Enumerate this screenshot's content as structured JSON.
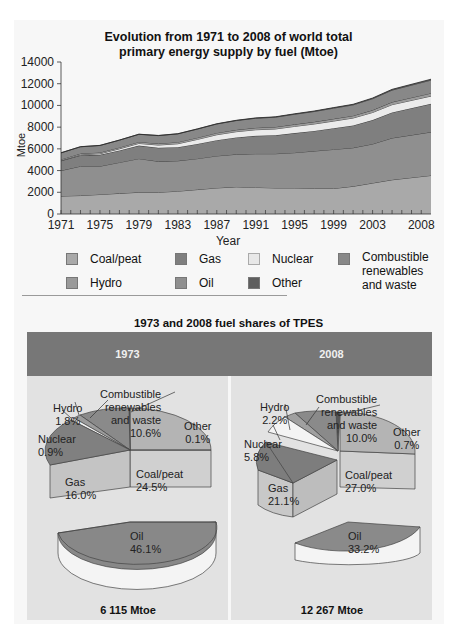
{
  "top_chart": {
    "title_line1": "Evolution from 1971 to 2008 of world total",
    "title_line2": "primary energy supply by fuel (Mtoe)",
    "ylabel": "Mtoe",
    "xlabel": "Year",
    "yticks": [
      "0",
      "2000",
      "4000",
      "6000",
      "8000",
      "10000",
      "12000",
      "14000"
    ],
    "xticks": [
      "1971",
      "1975",
      "1979",
      "1983",
      "1987",
      "1991",
      "1995",
      "1999",
      "2003",
      "2008"
    ]
  },
  "legend": {
    "coal": "Coal/peat",
    "gas": "Gas",
    "nuclear": "Nuclear",
    "combustible_1": "Combustible",
    "combustible_2": "renewables",
    "combustible_3": "and waste",
    "hydro": "Hydro",
    "oil": "Oil",
    "other": "Other"
  },
  "pie_section": {
    "title": "1973 and 2008 fuel shares of  TPES",
    "left": {
      "year": "1973",
      "total": "6 115 Mtoe",
      "labels": {
        "comb1": "Combustible",
        "comb2": "renewables",
        "comb3": "and waste",
        "comb_pct": "10.6%",
        "hydro": "Hydro",
        "hydro_pct": "1.8%",
        "nuclear": "Nuclear",
        "nuclear_pct": "0.9%",
        "other": "Other",
        "other_pct": "0.1%",
        "gas": "Gas",
        "gas_pct": "16.0%",
        "coal": "Coal/peat",
        "coal_pct": "24.5%",
        "oil": "Oil",
        "oil_pct": "46.1%"
      }
    },
    "right": {
      "year": "2008",
      "total": "12 267 Mtoe",
      "labels": {
        "comb1": "Combustible",
        "comb2": "renewables",
        "comb3": "and waste",
        "comb_pct": "10.0%",
        "hydro": "Hydro",
        "hydro_pct": "2.2%",
        "nuclear": "Nuclear",
        "nuclear_pct": "5.8%",
        "other": "Other",
        "other_pct": "0.7%",
        "gas": "Gas",
        "gas_pct": "21.1%",
        "coal": "Coal/peat",
        "coal_pct": "27.0%",
        "oil": "Oil",
        "oil_pct": "33.2%"
      }
    }
  },
  "colors": {
    "coal": "#a9a9a9",
    "oil": "#8c8c8c",
    "gas": "#7f7f7f",
    "nuclear": "#e6e6e6",
    "hydro": "#9a9a9a",
    "combustible": "#888888",
    "other": "#5e5e5e",
    "header": "#777777"
  },
  "chart_data": [
    {
      "type": "area",
      "title": "Evolution from 1971 to 2008 of world total primary energy supply by fuel (Mtoe)",
      "xlabel": "Year",
      "ylabel": "Mtoe",
      "ylim": [
        0,
        14000
      ],
      "x": [
        1971,
        1973,
        1975,
        1977,
        1979,
        1981,
        1983,
        1985,
        1987,
        1989,
        1991,
        1993,
        1995,
        1997,
        1999,
        2001,
        2003,
        2005,
        2008
      ],
      "stacked": true,
      "series": [
        {
          "name": "Coal/peat",
          "values": [
            1650,
            1700,
            1800,
            1900,
            2000,
            2000,
            2100,
            2250,
            2400,
            2500,
            2450,
            2400,
            2400,
            2350,
            2350,
            2550,
            2850,
            3150,
            3550
          ]
        },
        {
          "name": "Oil",
          "values": [
            2350,
            2700,
            2600,
            2850,
            3100,
            2850,
            2800,
            2850,
            2950,
            3000,
            3100,
            3150,
            3250,
            3450,
            3600,
            3550,
            3600,
            3850,
            4000
          ]
        },
        {
          "name": "Gas",
          "values": [
            900,
            1000,
            1050,
            1100,
            1200,
            1250,
            1250,
            1350,
            1450,
            1550,
            1650,
            1700,
            1800,
            1850,
            1950,
            2050,
            2200,
            2350,
            2600
          ]
        },
        {
          "name": "Nuclear",
          "values": [
            30,
            60,
            100,
            150,
            200,
            250,
            320,
            420,
            500,
            530,
            560,
            580,
            620,
            640,
            660,
            690,
            700,
            720,
            710
          ]
        },
        {
          "name": "Hydro",
          "values": [
            100,
            110,
            120,
            130,
            140,
            140,
            150,
            160,
            170,
            175,
            180,
            185,
            190,
            200,
            210,
            210,
            220,
            240,
            270
          ]
        },
        {
          "name": "Combustible renewables and waste",
          "values": [
            600,
            620,
            640,
            670,
            700,
            730,
            760,
            790,
            820,
            850,
            880,
            900,
            930,
            950,
            980,
            1000,
            1050,
            1100,
            1200
          ]
        },
        {
          "name": "Other",
          "values": [
            10,
            10,
            10,
            10,
            10,
            15,
            15,
            20,
            20,
            25,
            30,
            35,
            40,
            45,
            50,
            55,
            60,
            70,
            85
          ]
        }
      ],
      "legend_position": "bottom"
    },
    {
      "type": "pie",
      "title": "1973 fuel shares of TPES",
      "categories": [
        "Oil",
        "Coal/peat",
        "Gas",
        "Combustible renewables and waste",
        "Hydro",
        "Nuclear",
        "Other"
      ],
      "values": [
        46.1,
        24.5,
        16.0,
        10.6,
        1.8,
        0.9,
        0.1
      ],
      "total": "6 115 Mtoe"
    },
    {
      "type": "pie",
      "title": "2008 fuel shares of TPES",
      "categories": [
        "Oil",
        "Coal/peat",
        "Gas",
        "Combustible renewables and waste",
        "Hydro",
        "Nuclear",
        "Other"
      ],
      "values": [
        33.2,
        27.0,
        21.1,
        10.0,
        2.2,
        5.8,
        0.7
      ],
      "total": "12 267 Mtoe"
    }
  ]
}
